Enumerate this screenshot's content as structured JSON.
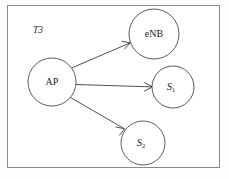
{
  "figure": {
    "title_label": "T3",
    "background_color": "#ffffff",
    "frame_color": "#8a8a8a",
    "stroke_color": "#3c3c3c",
    "node_stroke_color": "#4a4a4a",
    "text_color": "#1d1d1d"
  },
  "nodes": [
    {
      "id": "ap",
      "label": "AP",
      "subscript": "",
      "cx": 52,
      "cy": 82,
      "r": 24
    },
    {
      "id": "enb",
      "label": "eNB",
      "subscript": "",
      "cx": 154,
      "cy": 34,
      "r": 25
    },
    {
      "id": "s1",
      "label": "S",
      "subscript": "1",
      "cx": 173,
      "cy": 87,
      "r": 21
    },
    {
      "id": "s2",
      "label": "S",
      "subscript": "2",
      "cx": 143,
      "cy": 143,
      "r": 22
    }
  ],
  "edges": [
    {
      "id": "ap-to-enb",
      "from": "AP",
      "to": "eNB",
      "directed": true
    },
    {
      "id": "ap-to-s1",
      "from": "AP",
      "to": "S1",
      "directed": true
    },
    {
      "id": "ap-to-s2",
      "from": "AP",
      "to": "S2",
      "directed": true
    }
  ]
}
